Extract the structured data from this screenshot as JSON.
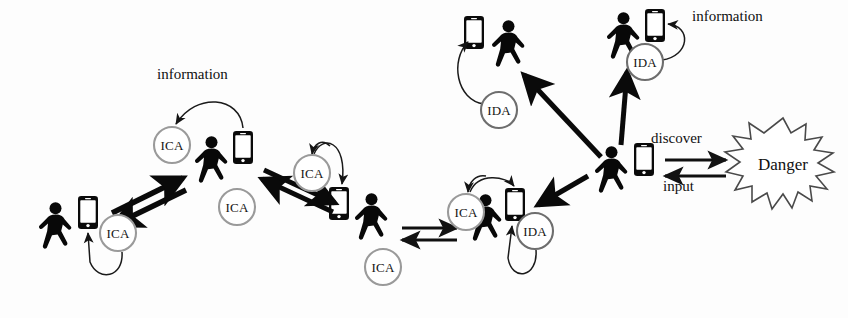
{
  "diagram": {
    "title": "",
    "background_color": "#fdfdfd",
    "ink_color": "#0a0a0a",
    "ring_color": "#9a9a9a",
    "labels": {
      "information_left": "information",
      "information_right": "information",
      "discover": "discover",
      "input": "input",
      "danger": "Danger"
    },
    "agents": [
      {
        "id": "ica-1",
        "label": "ICA",
        "x": 118,
        "y": 233,
        "r": 18,
        "owner": "person-1"
      },
      {
        "id": "ica-2",
        "label": "ICA",
        "x": 172,
        "y": 145,
        "r": 18,
        "owner": "person-2"
      },
      {
        "id": "ica-3",
        "label": "ICA",
        "x": 237,
        "y": 207,
        "r": 18,
        "owner": "person-2"
      },
      {
        "id": "ica-4",
        "label": "ICA",
        "x": 312,
        "y": 173,
        "r": 18,
        "owner": "person-3"
      },
      {
        "id": "ica-5",
        "label": "ICA",
        "x": 383,
        "y": 267,
        "r": 18,
        "owner": "person-3"
      },
      {
        "id": "ica-6",
        "label": "ICA",
        "x": 466,
        "y": 212,
        "r": 18,
        "owner": "person-4"
      },
      {
        "id": "ida-1",
        "label": "IDA",
        "x": 535,
        "y": 231,
        "r": 18,
        "owner": "person-4"
      },
      {
        "id": "ida-2",
        "label": "IDA",
        "x": 499,
        "y": 110,
        "r": 18,
        "owner": "person-5"
      },
      {
        "id": "ida-3",
        "label": "IDA",
        "x": 645,
        "y": 62,
        "r": 18,
        "owner": "person-6"
      }
    ],
    "people": [
      {
        "id": "person-1",
        "x": 55,
        "y": 228,
        "phone_side": "right",
        "phone_x": 85,
        "phone_y": 205
      },
      {
        "id": "person-2",
        "x": 218,
        "y": 165,
        "phone_side": "right",
        "phone_x": 243,
        "phone_y": 140
      },
      {
        "id": "person-3",
        "x": 368,
        "y": 221,
        "phone_side": "left",
        "phone_x": 340,
        "phone_y": 195
      },
      {
        "id": "person-4",
        "x": 492,
        "y": 222,
        "phone_side": "right",
        "phone_x": 513,
        "phone_y": 196
      },
      {
        "id": "person-5",
        "x": 505,
        "y": 48,
        "phone_side": "left",
        "phone_x": 480,
        "phone_y": 25
      },
      {
        "id": "person-6",
        "x": 622,
        "y": 38,
        "phone_side": "right",
        "phone_x": 650,
        "phone_y": 20
      },
      {
        "id": "person-hub",
        "x": 613,
        "y": 172,
        "phone_side": "right",
        "phone_x": 641,
        "phone_y": 152
      }
    ],
    "links": [
      {
        "from": "person-1",
        "to": "person-2",
        "style": "thick-double"
      },
      {
        "from": "person-2",
        "to": "person-3",
        "style": "thick-double"
      },
      {
        "from": "person-3",
        "to": "person-4",
        "style": "thin-double"
      },
      {
        "from": "person-hub",
        "to": "person-4",
        "style": "thick-single"
      },
      {
        "from": "person-hub",
        "to": "person-5",
        "style": "thick-single"
      },
      {
        "from": "person-hub",
        "to": "person-6",
        "style": "thick-single"
      },
      {
        "from": "person-hub",
        "to": "danger",
        "style": "labelled-double",
        "labels": [
          "discover",
          "input"
        ]
      }
    ]
  },
  "label_positions": {
    "information_left": {
      "x": 157,
      "y": 75
    },
    "information_right": {
      "x": 692,
      "y": 16
    },
    "discover": {
      "x": 651,
      "y": 139
    },
    "input": {
      "x": 660,
      "y": 186
    },
    "danger": {
      "x": 783,
      "y": 167
    }
  }
}
